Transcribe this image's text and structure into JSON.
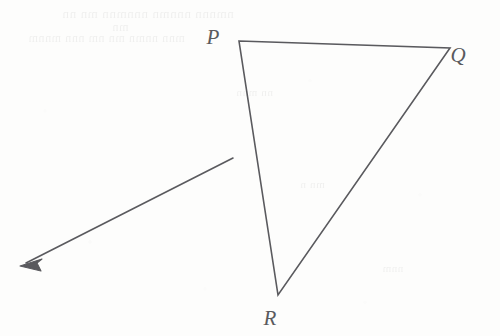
{
  "figure": {
    "kind": "geometry-diagram",
    "width": 500,
    "height": 336,
    "background_color": "#fdfdfc",
    "stroke_color": "#5a5a5e",
    "stroke_width": 1.6,
    "label_color": "#5a5a5e"
  },
  "triangle": {
    "name": "triangle-PQR",
    "vertices": [
      {
        "id": "P",
        "label": "P",
        "x": 239,
        "y": 41,
        "label_x": 213,
        "label_y": 44
      },
      {
        "id": "Q",
        "label": "Q",
        "x": 450,
        "y": 48,
        "label_x": 458,
        "label_y": 62
      },
      {
        "id": "R",
        "label": "R",
        "x": 278,
        "y": 295,
        "label_x": 270,
        "label_y": 325
      }
    ],
    "edges": [
      {
        "id": "PQ",
        "from": "P",
        "to": "Q"
      },
      {
        "id": "QR",
        "from": "Q",
        "to": "R"
      },
      {
        "id": "RP",
        "from": "R",
        "to": "P"
      }
    ],
    "path": "M 239 41 L 450 48 L 278 295 Z"
  },
  "arrow": {
    "name": "ray-arrow",
    "tail_x": 233,
    "tail_y": 158,
    "head_x": 20,
    "head_y": 266,
    "direction": "down-left",
    "head_style": "filled-barbed",
    "shaft_path": "M 233 158 L 26 263",
    "head_path": "M 20 266 L 42 259 L 37 263 L 41 271 Z"
  },
  "ghost_text": {
    "visible": true,
    "description": "faint bleed-through text from reverse of page, illegible",
    "lines": [
      {
        "text": "nmnnn nnnmn  nnnmnn  mn nn",
        "x": 62,
        "y": 6,
        "size": 13
      },
      {
        "text": "mn",
        "x": 112,
        "y": 20,
        "size": 12
      },
      {
        "text": "mnn nnmn mn  nm nnn mnnm",
        "x": 28,
        "y": 31,
        "size": 12
      },
      {
        "text": "nn mnn",
        "x": 236,
        "y": 86,
        "size": 11
      },
      {
        "text": "mn n",
        "x": 300,
        "y": 178,
        "size": 11
      },
      {
        "text": "nnm",
        "x": 382,
        "y": 262,
        "size": 11
      }
    ]
  }
}
